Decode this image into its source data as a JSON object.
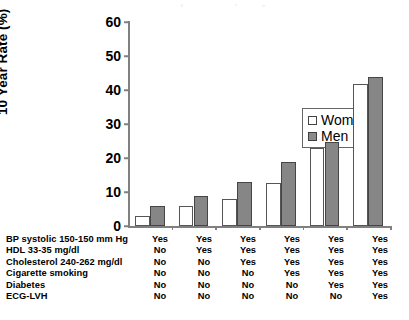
{
  "chart_data": {
    "type": "bar",
    "title": "",
    "subtitle": "",
    "xlabel": "",
    "ylabel": "10 Year Rate (%)",
    "ylim": [
      0,
      60
    ],
    "yticks": [
      0,
      10,
      20,
      30,
      40,
      50,
      60
    ],
    "ytick_labels": [
      "0",
      "10",
      "20",
      "30",
      "40",
      "50",
      "60"
    ],
    "grid": false,
    "legend_position": "upper-left-inside",
    "categories": [
      "1",
      "2",
      "3",
      "4",
      "5",
      "6"
    ],
    "series": [
      {
        "name": "Women",
        "color": "#ffffff",
        "values": [
          3.0,
          5.9,
          8.0,
          12.6,
          22.9,
          41.7
        ]
      },
      {
        "name": "Men",
        "color": "#868686",
        "values": [
          5.9,
          8.9,
          12.8,
          18.9,
          24.8,
          43.7
        ]
      }
    ],
    "annotations": []
  },
  "yaxis": {
    "title": "10 Year Rate (%)",
    "ticks": [
      {
        "value": 60,
        "label": "60"
      },
      {
        "value": 50,
        "label": "50"
      },
      {
        "value": 40,
        "label": "40"
      },
      {
        "value": 30,
        "label": "30"
      },
      {
        "value": 20,
        "label": "20"
      },
      {
        "value": 10,
        "label": "10"
      },
      {
        "value": 0,
        "label": "0"
      }
    ]
  },
  "legend": {
    "entries": [
      {
        "label": "Women",
        "swatch": "white-square-outline"
      },
      {
        "label": "Men",
        "swatch": "gray-filled-square"
      }
    ]
  },
  "risk_table": {
    "rows": [
      {
        "label": "BP systolic 150-150 mm Hg",
        "cells": [
          "Yes",
          "Yes",
          "Yes",
          "Yes",
          "Yes",
          "Yes"
        ]
      },
      {
        "label": "HDL 33-35 mg/dl",
        "cells": [
          "No",
          "Yes",
          "Yes",
          "Yes",
          "Yes",
          "Yes"
        ]
      },
      {
        "label": "Cholesterol 240-262 mg/dl",
        "cells": [
          "No",
          "No",
          "Yes",
          "Yes",
          "Yes",
          "Yes"
        ]
      },
      {
        "label": "Cigarette smoking",
        "cells": [
          "No",
          "No",
          "No",
          "Yes",
          "Yes",
          "Yes"
        ]
      },
      {
        "label": "Diabetes",
        "cells": [
          "No",
          "No",
          "No",
          "No",
          "Yes",
          "Yes"
        ]
      },
      {
        "label": "ECG-LVH",
        "cells": [
          "No",
          "No",
          "No",
          "No",
          "No",
          "Yes"
        ]
      }
    ]
  }
}
